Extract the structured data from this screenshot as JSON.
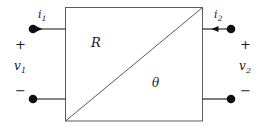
{
  "diagram": {
    "stroke_color": "#5a5a5a",
    "wire_color": "#111111",
    "text_color": "#1a1a1a",
    "background": "#ffffff",
    "box": {
      "label_top": "R",
      "label_bottom": "θ"
    },
    "left_port": {
      "current_label": "i",
      "current_subscript": "1",
      "current_direction": "into-network",
      "voltage_label": "v",
      "voltage_subscript": "1",
      "plus_sign": "+",
      "minus_sign": "−"
    },
    "right_port": {
      "current_label": "i",
      "current_subscript": "2",
      "current_direction": "into-network",
      "voltage_label": "v",
      "voltage_subscript": "2",
      "plus_sign": "+",
      "minus_sign": "−"
    }
  }
}
